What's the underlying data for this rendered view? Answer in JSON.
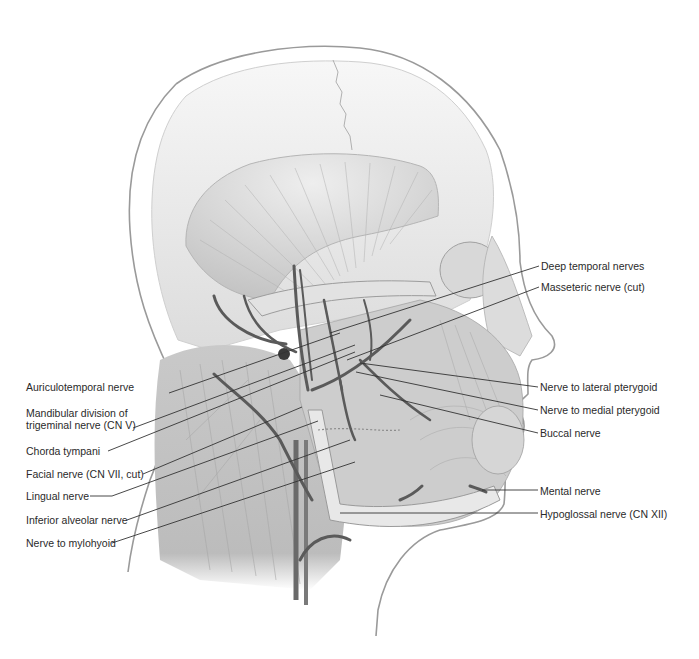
{
  "figure": {
    "colors": {
      "background": "#ffffff",
      "skin_outline": "#9a9a9a",
      "skull": "#ececec",
      "skull_shade": "#d4d4d4",
      "muscle": "#c8c8c8",
      "muscle_dark": "#a6a6a6",
      "nerve": "#5a5a5a",
      "leader": "#333333",
      "text": "#2a2a2a"
    }
  },
  "labels_left": [
    {
      "id": "auriculotemporal",
      "text": "Auriculotemporal nerve",
      "x": 26,
      "y": 387,
      "line": [
        169,
        393,
        340,
        333
      ]
    },
    {
      "id": "mandibular-division",
      "text": "Mandibular division of",
      "text2": "trigeminal nerve (CN V)",
      "x": 26,
      "y": 413,
      "line": [
        133,
        428,
        355,
        345
      ]
    },
    {
      "id": "chorda-tympani",
      "text": "Chorda tympani",
      "x": 26,
      "y": 446,
      "line": [
        108,
        451,
        355,
        352
      ]
    },
    {
      "id": "facial-nerve",
      "text": "Facial nerve (CN VII, cut)",
      "x": 26,
      "y": 468,
      "line": [
        143,
        474,
        302,
        407
      ]
    },
    {
      "id": "lingual-nerve",
      "text": "Lingual nerve",
      "x": 26,
      "y": 490,
      "line": [
        90,
        496,
        112,
        496,
        318,
        421
      ]
    },
    {
      "id": "inferior-alveolar",
      "text": "Inferior alveolar nerve",
      "x": 26,
      "y": 514,
      "line": [
        127,
        520,
        350,
        440
      ]
    },
    {
      "id": "nerve-to-mylohyoid",
      "text": "Nerve to mylohyoid",
      "x": 26,
      "y": 537,
      "line": [
        112,
        543,
        355,
        462
      ]
    }
  ],
  "labels_right": [
    {
      "id": "deep-temporal",
      "text": "Deep temporal nerves",
      "x": 541,
      "y": 260,
      "line": [
        539,
        266,
        330,
        333
      ]
    },
    {
      "id": "masseteric",
      "text": "Masseteric nerve (cut)",
      "x": 541,
      "y": 281,
      "line": [
        539,
        287,
        347,
        360
      ]
    },
    {
      "id": "lateral-pterygoid",
      "text": "Nerve to lateral pterygoid",
      "x": 540,
      "y": 381,
      "line": [
        538,
        387,
        360,
        363
      ]
    },
    {
      "id": "medial-pterygoid",
      "text": "Nerve to medial pterygoid",
      "x": 540,
      "y": 404,
      "line": [
        538,
        410,
        356,
        372
      ]
    },
    {
      "id": "buccal",
      "text": "Buccal nerve",
      "x": 540,
      "y": 427,
      "line": [
        538,
        433,
        380,
        395
      ]
    },
    {
      "id": "mental",
      "text": "Mental nerve",
      "x": 540,
      "y": 485,
      "line": [
        538,
        490,
        482,
        490
      ]
    },
    {
      "id": "hypoglossal",
      "text": "Hypoglossal nerve (CN XII)",
      "x": 540,
      "y": 509,
      "line": [
        538,
        513,
        340,
        513
      ]
    }
  ]
}
